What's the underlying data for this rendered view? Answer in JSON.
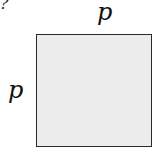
{
  "diagram": {
    "fragment_text": "?",
    "shape": "square",
    "fill_color": "#ececec",
    "border_color": "#2a2a2a",
    "labels": {
      "top_side": "p",
      "left_side": "p"
    }
  }
}
